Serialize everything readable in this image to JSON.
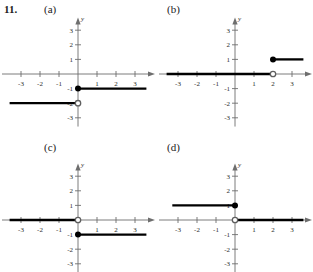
{
  "exercise": {
    "number": "11.",
    "panels": [
      {
        "key": "a",
        "label": "(a)"
      },
      {
        "key": "b",
        "label": "(b)"
      },
      {
        "key": "c",
        "label": "(c)"
      },
      {
        "key": "d",
        "label": "(d)"
      }
    ]
  },
  "axis": {
    "x_name": "x",
    "y_name": "y",
    "x_ticks": [
      "-3",
      "-2",
      "-1",
      "1",
      "2",
      "3"
    ],
    "y_ticks": [
      "3",
      "2",
      "1",
      "-1",
      "-2",
      "-3"
    ],
    "x_tick_values": [
      -3,
      -2,
      -1,
      1,
      2,
      3
    ],
    "y_tick_values": [
      3,
      2,
      1,
      -1,
      -2,
      -3
    ],
    "xlim": [
      -4.0,
      4.0
    ],
    "ylim": [
      -3.6,
      3.8
    ],
    "grid": "off",
    "color": "#6e6e6e"
  },
  "chart_data": [
    {
      "type": "line",
      "title": "(a)",
      "xlabel": "x",
      "ylabel": "y",
      "xlim": [
        -4.0,
        4.0
      ],
      "ylim": [
        -3.6,
        3.8
      ],
      "grid": "off",
      "xticks": [
        -3,
        -2,
        -1,
        1,
        2,
        3
      ],
      "yticks": [
        3,
        2,
        1,
        -1,
        -2,
        -3
      ],
      "legend": "none",
      "series": [
        {
          "name": "branch-right",
          "type": "ray",
          "y": -1,
          "x_start": 0,
          "x_end": 3.6,
          "endpoint": "closed",
          "endpoint_x": 0,
          "endpoint_y": -1
        },
        {
          "name": "branch-left",
          "type": "segment",
          "y": -2,
          "x_start": -3.6,
          "x_end": 0,
          "endpoint": "open",
          "endpoint_x": 0,
          "endpoint_y": -2
        }
      ]
    },
    {
      "type": "line",
      "title": "(b)",
      "xlabel": "x",
      "ylabel": "y",
      "xlim": [
        -4.0,
        4.0
      ],
      "ylim": [
        -3.6,
        3.8
      ],
      "grid": "off",
      "xticks": [
        -3,
        -2,
        -1,
        1,
        2,
        3
      ],
      "yticks": [
        3,
        2,
        1,
        -1,
        -2,
        -3
      ],
      "legend": "none",
      "series": [
        {
          "name": "branch-left",
          "type": "segment",
          "y": 0,
          "x_start": -3.6,
          "x_end": 2,
          "endpoint": "open",
          "endpoint_x": 2,
          "endpoint_y": 0
        },
        {
          "name": "branch-right",
          "type": "ray",
          "y": 1,
          "x_start": 2,
          "x_end": 3.6,
          "endpoint": "closed",
          "endpoint_x": 2,
          "endpoint_y": 1
        }
      ]
    },
    {
      "type": "line",
      "title": "(c)",
      "xlabel": "x",
      "ylabel": "y",
      "xlim": [
        -4.0,
        4.0
      ],
      "ylim": [
        -3.6,
        3.8
      ],
      "grid": "off",
      "xticks": [
        -3,
        -2,
        -1,
        1,
        2,
        3
      ],
      "yticks": [
        3,
        2,
        1,
        -1,
        -2,
        -3
      ],
      "legend": "none",
      "series": [
        {
          "name": "branch-left",
          "type": "segment",
          "y": 0,
          "x_start": -3.6,
          "x_end": 0,
          "endpoint": "open",
          "endpoint_x": 0,
          "endpoint_y": 0
        },
        {
          "name": "branch-right",
          "type": "ray",
          "y": -1,
          "x_start": 0,
          "x_end": 3.6,
          "endpoint": "closed",
          "endpoint_x": 0,
          "endpoint_y": -1
        }
      ]
    },
    {
      "type": "line",
      "title": "(d)",
      "xlabel": "x",
      "ylabel": "y",
      "xlim": [
        -4.0,
        4.0
      ],
      "ylim": [
        -3.6,
        3.8
      ],
      "grid": "off",
      "xticks": [
        -3,
        -2,
        -1,
        1,
        2,
        3
      ],
      "yticks": [
        3,
        2,
        1,
        -1,
        -2,
        -3
      ],
      "legend": "none",
      "series": [
        {
          "name": "branch-left",
          "type": "segment",
          "y": 1,
          "x_start": -3.3,
          "x_end": 0,
          "endpoint": "closed",
          "endpoint_x": 0,
          "endpoint_y": 1
        },
        {
          "name": "branch-right",
          "type": "ray",
          "y": 0,
          "x_start": 0,
          "x_end": 3.6,
          "endpoint": "open",
          "endpoint_x": 0,
          "endpoint_y": 0
        }
      ]
    }
  ]
}
